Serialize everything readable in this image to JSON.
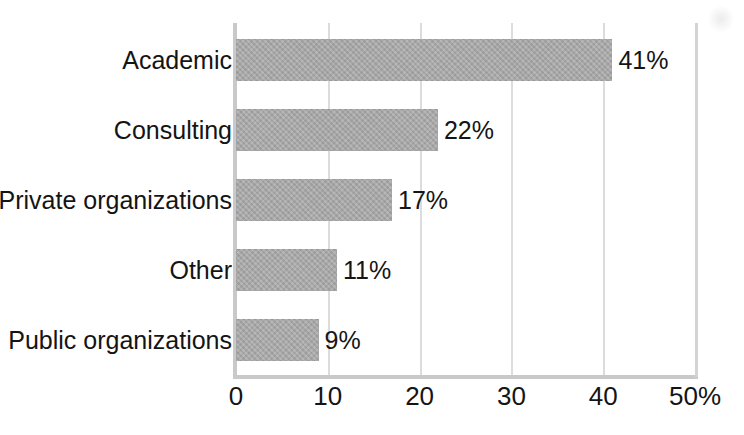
{
  "chart_data": {
    "type": "bar",
    "orientation": "horizontal",
    "title": "",
    "subtitle": "",
    "xlabel": "",
    "ylabel": "",
    "categories": [
      "Academic",
      "Consulting",
      "Private organizations",
      "Other",
      "Public organizations"
    ],
    "values": [
      41,
      22,
      17,
      11,
      9
    ],
    "data_labels": [
      "41%",
      "22%",
      "17%",
      "11%",
      "9%"
    ],
    "xlim": [
      0,
      50
    ],
    "xticks": [
      0,
      10,
      20,
      30,
      40,
      50
    ],
    "xtick_labels": [
      "0",
      "10",
      "20",
      "30",
      "40",
      "50%"
    ],
    "grid": "vertical",
    "legend": "none",
    "units": "percent",
    "bar_color": "#a9a9a9",
    "gridline_color": "#dcdcdc",
    "axis_color": "#c9c9c9",
    "text_color": "#141414"
  },
  "axis": {
    "ticks": [
      {
        "label": "0",
        "value": 0
      },
      {
        "label": "10",
        "value": 10
      },
      {
        "label": "20",
        "value": 20
      },
      {
        "label": "30",
        "value": 30
      },
      {
        "label": "40",
        "value": 40
      },
      {
        "label": "50%",
        "value": 50
      }
    ]
  },
  "rows": [
    {
      "label": "Academic",
      "value": 41,
      "data_label": "41%"
    },
    {
      "label": "Consulting",
      "value": 22,
      "data_label": "22%"
    },
    {
      "label": "Private organizations",
      "value": 17,
      "data_label": "17%"
    },
    {
      "label": "Other",
      "value": 11,
      "data_label": "11%"
    },
    {
      "label": "Public organizations",
      "value": 9,
      "data_label": "9%"
    }
  ]
}
